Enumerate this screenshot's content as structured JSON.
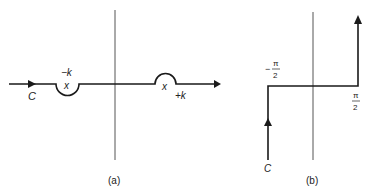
{
  "figure_a": {
    "caption": "(a)",
    "contour_label": "C",
    "pole_left_label": "−k",
    "pole_right_label": "+k",
    "pole_marker": "x"
  },
  "figure_b": {
    "caption": "(b)",
    "contour_label": "C",
    "left_label_sign": "−",
    "left_label_num": "π",
    "left_label_den": "2",
    "right_label_num": "π",
    "right_label_den": "2"
  },
  "colors": {
    "line": "#1a1a1a",
    "axis": "#555555"
  }
}
